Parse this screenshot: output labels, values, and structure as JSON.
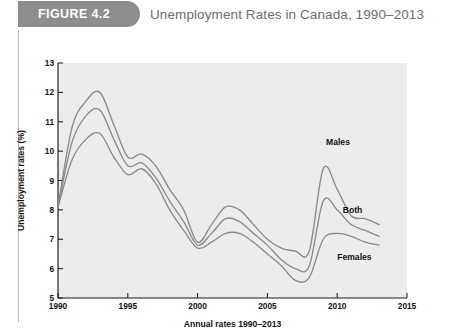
{
  "figure": {
    "tab_label": "FIGURE 4.2",
    "title": "Unemployment Rates in Canada, 1990–2013",
    "tab_color": "#8e8e8e",
    "title_color": "#6d6d6d"
  },
  "chart_data": {
    "type": "line",
    "title": "Unemployment Rates in Canada, 1990–2013",
    "xlabel": "Annual rates 1990–2013",
    "ylabel": "Unemployment rates (%)",
    "xlim": [
      1990,
      2015
    ],
    "ylim": [
      5,
      13
    ],
    "grid": false,
    "legend": "inline-annotations",
    "line_color": "#8a8a8a",
    "plot_background": "#ececed",
    "x_ticks": [
      1990,
      1995,
      2000,
      2005,
      2010,
      2015
    ],
    "x_tick_labels": [
      "1990",
      "1995",
      "2000",
      "2005",
      "2010",
      "2015"
    ],
    "y_ticks": [
      5,
      6,
      7,
      8,
      9,
      10,
      11,
      12,
      13
    ],
    "y_tick_labels": [
      "5",
      "6",
      "7",
      "8",
      "9",
      "10",
      "11",
      "12",
      "13"
    ],
    "x": [
      1990,
      1991,
      1992,
      1993,
      1994,
      1995,
      1996,
      1997,
      1998,
      1999,
      2000,
      2001,
      2002,
      2003,
      2004,
      2005,
      2006,
      2007,
      2008,
      2009,
      2010,
      2011,
      2012,
      2013
    ],
    "series": [
      {
        "name": "Males",
        "label": "Males",
        "values": [
          8.1,
          10.8,
          11.7,
          12.0,
          10.9,
          9.8,
          9.9,
          9.5,
          8.7,
          8.0,
          6.9,
          7.5,
          8.1,
          8.0,
          7.5,
          7.0,
          6.7,
          6.6,
          6.6,
          9.4,
          8.7,
          7.8,
          7.7,
          7.5
        ],
        "peak_1993": 12.0,
        "peak_2009": 9.4,
        "trough_2000": 6.9
      },
      {
        "name": "Both",
        "label": "Both",
        "values": [
          8.1,
          10.3,
          11.2,
          11.4,
          10.4,
          9.5,
          9.6,
          9.1,
          8.3,
          7.6,
          6.8,
          7.2,
          7.7,
          7.6,
          7.2,
          6.8,
          6.3,
          6.0,
          6.1,
          8.3,
          8.0,
          7.5,
          7.3,
          7.1
        ],
        "peak_1993": 11.4,
        "peak_2009": 8.3,
        "trough_2000": 6.8
      },
      {
        "name": "Females",
        "label": "Females",
        "values": [
          8.1,
          9.7,
          10.4,
          10.6,
          9.8,
          9.2,
          9.4,
          8.9,
          8.0,
          7.3,
          6.7,
          6.9,
          7.2,
          7.2,
          6.9,
          6.5,
          6.1,
          5.6,
          5.7,
          7.0,
          7.2,
          7.1,
          6.9,
          6.8
        ],
        "peak_1993": 10.6,
        "peak_2009": 7.0,
        "trough_2007": 5.6
      }
    ],
    "annotations": [
      {
        "text": "Males",
        "x": 2009.2,
        "y": 10.2
      },
      {
        "text": "Both",
        "x": 2010.4,
        "y": 7.9
      },
      {
        "text": "Females",
        "x": 2010.0,
        "y": 6.3
      }
    ]
  }
}
